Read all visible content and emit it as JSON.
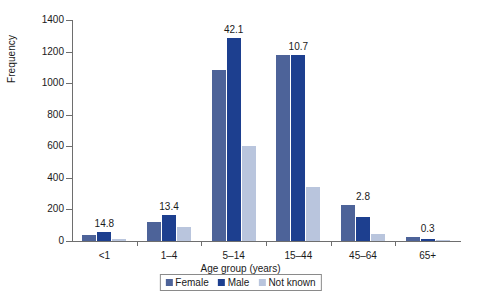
{
  "chart_data": {
    "type": "bar",
    "title": "",
    "xlabel": "Age group (years)",
    "ylabel": "Frequency",
    "ylim": [
      0,
      1400
    ],
    "ytick_values": [
      0,
      200,
      400,
      600,
      800,
      1000,
      1200,
      1400
    ],
    "ytick_labels": [
      "0",
      "200",
      "400",
      "600",
      "800",
      "1000",
      "1200",
      "1400"
    ],
    "grid": false,
    "legend_position": "bottom-center",
    "categories": [
      "<1",
      "1–4",
      "5–14",
      "15–44",
      "45–64",
      "65+"
    ],
    "series": [
      {
        "name": "Female",
        "color": "#4d6399",
        "values": [
          35,
          120,
          1085,
          1180,
          225,
          25
        ]
      },
      {
        "name": "Male",
        "color": "#1d3f8f",
        "values": [
          55,
          163,
          1285,
          1180,
          150,
          12
        ]
      },
      {
        "name": "Not known",
        "color": "#b9c5dd",
        "values": [
          10,
          88,
          600,
          345,
          42,
          6
        ]
      }
    ],
    "group_annotations": [
      "14.8",
      "13.4",
      "42.1",
      "10.7",
      "2.8",
      "0.3"
    ]
  }
}
